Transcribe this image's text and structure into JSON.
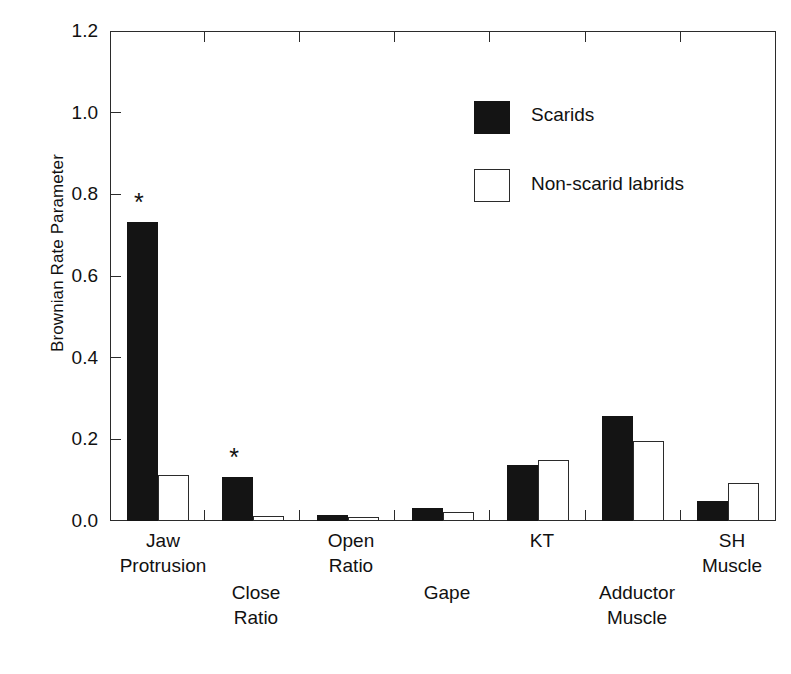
{
  "chart_data": {
    "type": "bar",
    "title": "",
    "subtitle": "",
    "xlabel": "",
    "ylabel": "Brownian Rate Parameter",
    "ylim": [
      0.0,
      1.2
    ],
    "yticks": [
      "0.0",
      "0.2",
      "0.4",
      "0.6",
      "0.8",
      "1.0",
      "1.2"
    ],
    "ytick_values": [
      0.0,
      0.2,
      0.4,
      0.6,
      0.8,
      1.0,
      1.2
    ],
    "grid": false,
    "legend_position": "upper-center-right",
    "categories": [
      "Jaw Protrusion",
      "Close Ratio",
      "Open Ratio",
      "Gape",
      "KT",
      "Adductor Muscle",
      "SH Muscle"
    ],
    "category_lines": [
      [
        "Jaw",
        "Protrusion"
      ],
      [
        "Close",
        "Ratio"
      ],
      [
        "Open",
        "Ratio"
      ],
      [
        "Gape",
        ""
      ],
      [
        "KT",
        ""
      ],
      [
        "Adductor",
        "Muscle"
      ],
      [
        "SH",
        "Muscle"
      ]
    ],
    "series": [
      {
        "name": "Scarids",
        "color": "#141414",
        "fill": "solid",
        "values": [
          0.733,
          0.107,
          0.015,
          0.031,
          0.138,
          0.258,
          0.05
        ]
      },
      {
        "name": "Non-scarid labrids",
        "color": "#ffffff",
        "fill": "open",
        "values": [
          0.113,
          0.012,
          0.009,
          0.022,
          0.15,
          0.197,
          0.093
        ]
      }
    ],
    "annotations": [
      {
        "text": "*",
        "category": "Jaw Protrusion",
        "series": "Scarids",
        "note": "significance marker"
      },
      {
        "text": "*",
        "category": "Close Ratio",
        "series": "Scarids",
        "note": "significance marker"
      }
    ]
  },
  "legend": {
    "entries": [
      {
        "label": "Scarids",
        "swatch": "filled-black-square"
      },
      {
        "label": "Non-scarid labrids",
        "swatch": "open-white-square"
      }
    ]
  },
  "axis": {
    "y_title": "Brownian Rate Parameter"
  }
}
